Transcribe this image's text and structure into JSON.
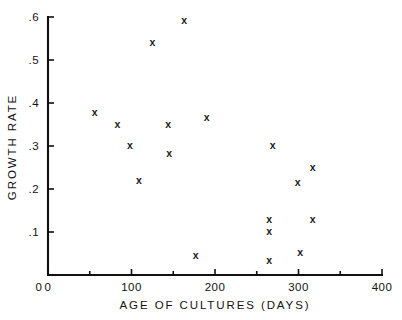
{
  "chart_data": {
    "type": "scatter",
    "title": "",
    "xlabel": "AGE OF CULTURES (DAYS)",
    "ylabel": "GROWTH RATE",
    "xlim": [
      0,
      400
    ],
    "ylim": [
      0,
      0.6
    ],
    "grid": false,
    "legend": null,
    "marker": "x",
    "x_major_ticks": [
      0,
      100,
      200,
      300,
      400
    ],
    "x_major_tick_labels": [
      "0",
      "100",
      "200",
      "300",
      "400"
    ],
    "x_minor_ticks": [
      50,
      150,
      250,
      350
    ],
    "y_major_ticks": [
      0.1,
      0.2,
      0.3,
      0.4,
      0.5,
      0.6
    ],
    "y_major_tick_labels": [
      ".1",
      ".2",
      ".3",
      ".4",
      ".5",
      ".6"
    ],
    "y_origin_label": "0",
    "points": [
      {
        "x": 56,
        "y": 0.379
      },
      {
        "x": 83,
        "y": 0.351
      },
      {
        "x": 98,
        "y": 0.302
      },
      {
        "x": 109,
        "y": 0.221
      },
      {
        "x": 125,
        "y": 0.542
      },
      {
        "x": 144,
        "y": 0.351
      },
      {
        "x": 145,
        "y": 0.284
      },
      {
        "x": 163,
        "y": 0.593
      },
      {
        "x": 177,
        "y": 0.047
      },
      {
        "x": 190,
        "y": 0.367
      },
      {
        "x": 265,
        "y": 0.13
      },
      {
        "x": 265,
        "y": 0.102
      },
      {
        "x": 265,
        "y": 0.035
      },
      {
        "x": 269,
        "y": 0.302
      },
      {
        "x": 299,
        "y": 0.216
      },
      {
        "x": 302,
        "y": 0.053
      },
      {
        "x": 317,
        "y": 0.251
      },
      {
        "x": 317,
        "y": 0.13
      }
    ]
  },
  "axes": {
    "x_axis_name": "age-of-cultures-axis",
    "y_axis_name": "growth-rate-axis"
  }
}
